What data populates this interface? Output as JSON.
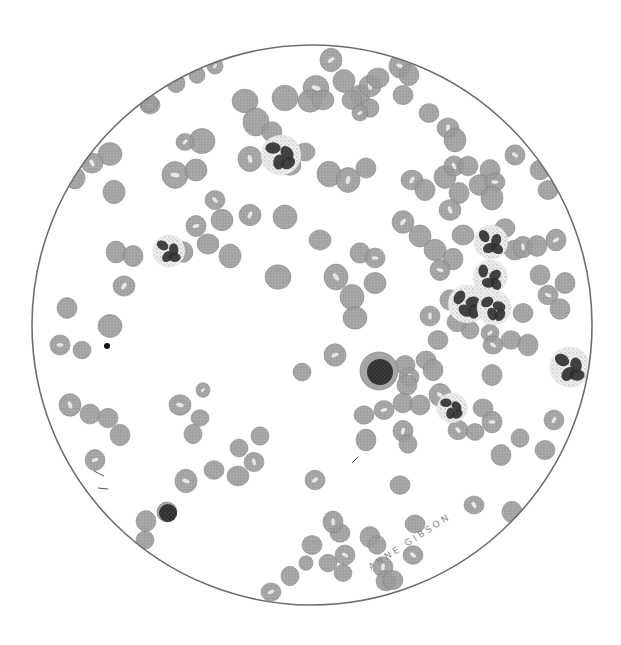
{
  "figure": {
    "artist_signature": "ANNE GIBSON",
    "field": {
      "cx": 312,
      "cy": 325,
      "r": 280,
      "stroke": "#6e6e6e"
    },
    "colors": {
      "rbc_fill": "#9a9a9a",
      "rbc_edge": "#7d7d7d",
      "rbc_pallor": "#e6e6e6",
      "granule": "#9c9c9c",
      "nucleus": "#2f2f2f",
      "lymph_cytoplasm": "#a5a5a5"
    }
  },
  "cells": {
    "rbc": [
      [
        150,
        105,
        10
      ],
      [
        176,
        83,
        9
      ],
      [
        197,
        75,
        8
      ],
      [
        215,
        66,
        8
      ],
      [
        149,
        103,
        9
      ],
      [
        110,
        154,
        12
      ],
      [
        92,
        163,
        11
      ],
      [
        75,
        178,
        10
      ],
      [
        114,
        192,
        11
      ],
      [
        175,
        175,
        13
      ],
      [
        196,
        170,
        11
      ],
      [
        202,
        141,
        13
      ],
      [
        185,
        142,
        9
      ],
      [
        245,
        101,
        13
      ],
      [
        256,
        122,
        13
      ],
      [
        250,
        159,
        12
      ],
      [
        272,
        132,
        10
      ],
      [
        285,
        98,
        13
      ],
      [
        316,
        88,
        13
      ],
      [
        310,
        101,
        12
      ],
      [
        323,
        100,
        11
      ],
      [
        331,
        60,
        11
      ],
      [
        344,
        81,
        11
      ],
      [
        360,
        95,
        10
      ],
      [
        370,
        86,
        11
      ],
      [
        352,
        100,
        10
      ],
      [
        378,
        78,
        11
      ],
      [
        400,
        66,
        11
      ],
      [
        409,
        75,
        10
      ],
      [
        370,
        108,
        9
      ],
      [
        360,
        113,
        8
      ],
      [
        403,
        95,
        10
      ],
      [
        429,
        113,
        10
      ],
      [
        448,
        128,
        11
      ],
      [
        455,
        140,
        11
      ],
      [
        490,
        170,
        10
      ],
      [
        515,
        155,
        10
      ],
      [
        540,
        170,
        10
      ],
      [
        548,
        190,
        10
      ],
      [
        290,
        165,
        11
      ],
      [
        305,
        152,
        10
      ],
      [
        329,
        174,
        12
      ],
      [
        348,
        180,
        12
      ],
      [
        366,
        168,
        10
      ],
      [
        222,
        220,
        11
      ],
      [
        215,
        200,
        10
      ],
      [
        208,
        244,
        11
      ],
      [
        230,
        256,
        11
      ],
      [
        196,
        226,
        10
      ],
      [
        183,
        252,
        10
      ],
      [
        285,
        217,
        12
      ],
      [
        250,
        215,
        11
      ],
      [
        278,
        277,
        13
      ],
      [
        320,
        240,
        11
      ],
      [
        336,
        277,
        12
      ],
      [
        352,
        297,
        12
      ],
      [
        360,
        253,
        10
      ],
      [
        375,
        258,
        10
      ],
      [
        375,
        283,
        11
      ],
      [
        355,
        318,
        12
      ],
      [
        412,
        180,
        11
      ],
      [
        425,
        190,
        10
      ],
      [
        445,
        177,
        11
      ],
      [
        454,
        166,
        10
      ],
      [
        468,
        166,
        10
      ],
      [
        480,
        185,
        11
      ],
      [
        495,
        182,
        10
      ],
      [
        492,
        198,
        11
      ],
      [
        459,
        193,
        10
      ],
      [
        403,
        222,
        11
      ],
      [
        420,
        236,
        11
      ],
      [
        435,
        250,
        11
      ],
      [
        450,
        210,
        11
      ],
      [
        463,
        235,
        11
      ],
      [
        453,
        259,
        10
      ],
      [
        440,
        270,
        10
      ],
      [
        450,
        300,
        10
      ],
      [
        470,
        330,
        9
      ],
      [
        490,
        333,
        9
      ],
      [
        505,
        228,
        10
      ],
      [
        515,
        250,
        11
      ],
      [
        523,
        247,
        10
      ],
      [
        537,
        246,
        10
      ],
      [
        540,
        275,
        10
      ],
      [
        548,
        295,
        10
      ],
      [
        523,
        313,
        10
      ],
      [
        511,
        340,
        10
      ],
      [
        556,
        240,
        10
      ],
      [
        565,
        283,
        10
      ],
      [
        560,
        309,
        10
      ],
      [
        430,
        316,
        10
      ],
      [
        457,
        322,
        10
      ],
      [
        438,
        340,
        10
      ],
      [
        493,
        345,
        10
      ],
      [
        528,
        345,
        10
      ],
      [
        492,
        375,
        10
      ],
      [
        335,
        355,
        11
      ],
      [
        302,
        372,
        9
      ],
      [
        405,
        365,
        10
      ],
      [
        409,
        377,
        10
      ],
      [
        426,
        360,
        10
      ],
      [
        433,
        370,
        10
      ],
      [
        440,
        395,
        11
      ],
      [
        407,
        385,
        10
      ],
      [
        403,
        403,
        10
      ],
      [
        384,
        410,
        10
      ],
      [
        364,
        415,
        10
      ],
      [
        366,
        440,
        10
      ],
      [
        403,
        431,
        10
      ],
      [
        408,
        444,
        9
      ],
      [
        420,
        405,
        10
      ],
      [
        458,
        430,
        10
      ],
      [
        475,
        432,
        9
      ],
      [
        483,
        408,
        10
      ],
      [
        492,
        422,
        10
      ],
      [
        501,
        455,
        10
      ],
      [
        520,
        438,
        9
      ],
      [
        554,
        420,
        10
      ],
      [
        545,
        450,
        10
      ],
      [
        400,
        485,
        10
      ],
      [
        474,
        505,
        10
      ],
      [
        512,
        512,
        10
      ],
      [
        67,
        308,
        10
      ],
      [
        60,
        345,
        10
      ],
      [
        82,
        350,
        9
      ],
      [
        110,
        326,
        12
      ],
      [
        124,
        286,
        11
      ],
      [
        116,
        252,
        10
      ],
      [
        133,
        256,
        10
      ],
      [
        70,
        405,
        11
      ],
      [
        90,
        414,
        10
      ],
      [
        108,
        418,
        10
      ],
      [
        180,
        405,
        11
      ],
      [
        200,
        418,
        9
      ],
      [
        193,
        434,
        9
      ],
      [
        203,
        390,
        7
      ],
      [
        260,
        436,
        9
      ],
      [
        239,
        448,
        9
      ],
      [
        254,
        462,
        10
      ],
      [
        214,
        470,
        10
      ],
      [
        238,
        476,
        11
      ],
      [
        186,
        481,
        11
      ],
      [
        146,
        521,
        10
      ],
      [
        145,
        540,
        9
      ],
      [
        315,
        480,
        10
      ],
      [
        312,
        545,
        10
      ],
      [
        340,
        533,
        10
      ],
      [
        333,
        522,
        10
      ],
      [
        370,
        537,
        10
      ],
      [
        377,
        545,
        9
      ],
      [
        345,
        555,
        10
      ],
      [
        328,
        563,
        9
      ],
      [
        343,
        573,
        9
      ],
      [
        271,
        592,
        10
      ],
      [
        290,
        576,
        9
      ],
      [
        306,
        563,
        7
      ],
      [
        383,
        567,
        10
      ],
      [
        386,
        581,
        10
      ],
      [
        393,
        580,
        10
      ],
      [
        413,
        555,
        10
      ],
      [
        415,
        524,
        10
      ],
      [
        120,
        435,
        10
      ],
      [
        95,
        460,
        10
      ]
    ],
    "neutrophils": [
      {
        "cx": 281,
        "cy": 155,
        "r": 20
      },
      {
        "cx": 169,
        "cy": 251,
        "r": 16
      },
      {
        "cx": 491,
        "cy": 242,
        "r": 17
      },
      {
        "cx": 490,
        "cy": 277,
        "r": 17
      },
      {
        "cx": 467,
        "cy": 304,
        "r": 19
      },
      {
        "cx": 494,
        "cy": 308,
        "r": 17
      },
      {
        "cx": 452,
        "cy": 408,
        "r": 15
      },
      {
        "cx": 570,
        "cy": 367,
        "r": 20
      }
    ],
    "lymphocytes": [
      {
        "cx": 379,
        "cy": 371,
        "r": 19,
        "nucleus_r": 13
      },
      {
        "cx": 167,
        "cy": 512,
        "r": 10,
        "nucleus_r": 9
      }
    ],
    "artifacts": [
      {
        "type": "dark-blob",
        "cx": 107,
        "cy": 346,
        "r": 3
      },
      {
        "type": "dash",
        "x1": 352,
        "y1": 463,
        "x2": 358,
        "y2": 457
      },
      {
        "type": "dash",
        "x1": 94,
        "y1": 471,
        "x2": 104,
        "y2": 476
      },
      {
        "type": "dash",
        "x1": 98,
        "y1": 488,
        "x2": 108,
        "y2": 489
      }
    ]
  }
}
